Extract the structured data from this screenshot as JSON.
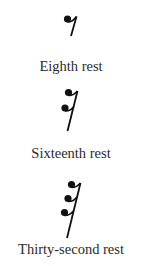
{
  "items": [
    {
      "label": "Eighth rest",
      "icon": "eighth-rest-icon",
      "flags": 1
    },
    {
      "label": "Sixteenth rest",
      "icon": "sixteenth-rest-icon",
      "flags": 2
    },
    {
      "label": "Thirty-second rest",
      "icon": "thirty-second-rest-icon",
      "flags": 3
    }
  ],
  "colors": {
    "glyph": "#111111",
    "text": "#2a2a2a",
    "background": "#ffffff"
  }
}
